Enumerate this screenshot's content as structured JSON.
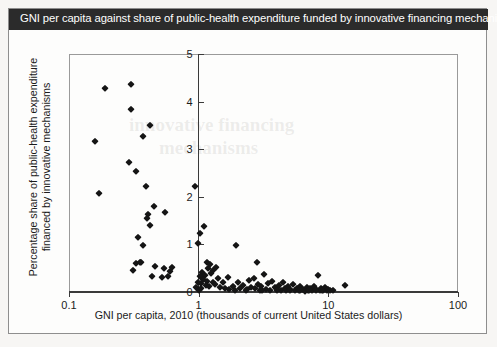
{
  "figure": {
    "title": "GNI per capita against share of public-health expenditure funded by innovative financing mechanisms",
    "title_bg": "#2b2b2b",
    "title_color": "#ffffff",
    "border_color": "#8e8e8e",
    "background": "#fdfdfc"
  },
  "chart_data": {
    "type": "scatter",
    "title": "GNI per capita against share of public-health expenditure funded by innovative financing mechanisms",
    "xlabel": "GNI per capita, 2010 (thousands of current United States dollars)",
    "ylabel": "Percentage share of public-health expenditure financed by innovative mechanisms",
    "x_scale": "log",
    "y_scale": "linear",
    "xlim": [
      0.1,
      100
    ],
    "ylim": [
      0,
      5
    ],
    "x_ticks": [
      0.1,
      1,
      10,
      100
    ],
    "x_tick_labels": [
      "0.1",
      "1",
      "10",
      "100"
    ],
    "y_ticks": [
      0,
      1,
      2,
      3,
      4,
      5
    ],
    "y_tick_labels": [
      "0",
      "1",
      "2",
      "3",
      "4",
      "5"
    ],
    "grid": false,
    "legend": null,
    "marker": "diamond",
    "marker_color": "#151515",
    "series": [
      {
        "name": "Countries",
        "points": [
          [
            0.19,
            4.28
          ],
          [
            0.3,
            4.36
          ],
          [
            0.3,
            3.85
          ],
          [
            0.42,
            3.5
          ],
          [
            0.16,
            3.18
          ],
          [
            0.37,
            3.28
          ],
          [
            0.29,
            2.73
          ],
          [
            0.33,
            2.55
          ],
          [
            0.39,
            2.22
          ],
          [
            0.17,
            2.09
          ],
          [
            0.93,
            2.22
          ],
          [
            0.45,
            1.8
          ],
          [
            0.41,
            1.63
          ],
          [
            0.4,
            1.56
          ],
          [
            0.55,
            1.68
          ],
          [
            0.42,
            1.4
          ],
          [
            1.1,
            1.38
          ],
          [
            1.02,
            1.25
          ],
          [
            0.34,
            1.15
          ],
          [
            0.98,
            1.02
          ],
          [
            0.37,
            0.98
          ],
          [
            1.95,
            0.98
          ],
          [
            0.33,
            0.61
          ],
          [
            0.35,
            0.63
          ],
          [
            0.36,
            0.62
          ],
          [
            0.46,
            0.55
          ],
          [
            0.31,
            0.47
          ],
          [
            0.54,
            0.5
          ],
          [
            0.62,
            0.52
          ],
          [
            0.6,
            0.45
          ],
          [
            0.44,
            0.33
          ],
          [
            0.52,
            0.31
          ],
          [
            0.58,
            0.34
          ],
          [
            1.15,
            0.63
          ],
          [
            1.22,
            0.58
          ],
          [
            1.18,
            0.5
          ],
          [
            1.28,
            0.47
          ],
          [
            1.06,
            0.42
          ],
          [
            1.12,
            0.36
          ],
          [
            1.24,
            0.4
          ],
          [
            1.35,
            0.52
          ],
          [
            1.08,
            0.28
          ],
          [
            1.16,
            0.24
          ],
          [
            1.3,
            0.22
          ],
          [
            1.4,
            0.3
          ],
          [
            1.05,
            0.18
          ],
          [
            1.13,
            0.14
          ],
          [
            1.21,
            0.12
          ],
          [
            1.33,
            0.16
          ],
          [
            1.45,
            0.1
          ],
          [
            1.55,
            0.2
          ],
          [
            1.6,
            0.08
          ],
          [
            1.72,
            0.06
          ],
          [
            1.85,
            0.12
          ],
          [
            2.0,
            0.22
          ],
          [
            2.1,
            0.08
          ],
          [
            2.2,
            0.14
          ],
          [
            2.35,
            0.06
          ],
          [
            2.45,
            0.26
          ],
          [
            2.55,
            0.1
          ],
          [
            2.65,
            0.3
          ],
          [
            2.72,
            0.08
          ],
          [
            2.85,
            0.16
          ],
          [
            2.95,
            0.05
          ],
          [
            3.05,
            0.12
          ],
          [
            3.2,
            0.38
          ],
          [
            3.3,
            0.07
          ],
          [
            3.45,
            0.18
          ],
          [
            3.55,
            0.05
          ],
          [
            3.7,
            0.24
          ],
          [
            3.85,
            0.1
          ],
          [
            4.0,
            0.06
          ],
          [
            4.15,
            0.14
          ],
          [
            4.3,
            0.04
          ],
          [
            4.45,
            0.2
          ],
          [
            4.6,
            0.08
          ],
          [
            4.75,
            0.05
          ],
          [
            4.9,
            0.12
          ],
          [
            5.1,
            0.06
          ],
          [
            5.3,
            0.16
          ],
          [
            5.5,
            0.04
          ],
          [
            5.7,
            0.09
          ],
          [
            5.9,
            0.05
          ],
          [
            6.1,
            0.13
          ],
          [
            6.35,
            0.07
          ],
          [
            6.55,
            0.03
          ],
          [
            6.8,
            0.1
          ],
          [
            7.0,
            0.05
          ],
          [
            7.25,
            0.08
          ],
          [
            7.5,
            0.04
          ],
          [
            7.75,
            0.12
          ],
          [
            8.0,
            0.06
          ],
          [
            8.3,
            0.35
          ],
          [
            8.55,
            0.04
          ],
          [
            8.8,
            0.08
          ],
          [
            9.1,
            0.05
          ],
          [
            9.4,
            0.1
          ],
          [
            9.7,
            0.04
          ],
          [
            10.0,
            0.06
          ],
          [
            10.3,
            0.04
          ],
          [
            10.8,
            0.05
          ],
          [
            13.5,
            0.14
          ],
          [
            2.8,
            0.62
          ],
          [
            1.68,
            0.32
          ],
          [
            1.9,
            0.04
          ],
          [
            2.3,
            0.04
          ],
          [
            3.1,
            0.04
          ],
          [
            4.05,
            0.04
          ],
          [
            5.05,
            0.04
          ],
          [
            6.0,
            0.04
          ],
          [
            7.1,
            0.04
          ],
          [
            8.1,
            0.04
          ],
          [
            9.0,
            0.04
          ],
          [
            0.95,
            0.1
          ],
          [
            1.0,
            0.05
          ],
          [
            1.02,
            0.33
          ],
          [
            0.99,
            0.2
          ],
          [
            1.04,
            0.08
          ]
        ]
      }
    ]
  },
  "ghost_text": {
    "line1": "innovative financing",
    "line2": "mechanisms"
  }
}
